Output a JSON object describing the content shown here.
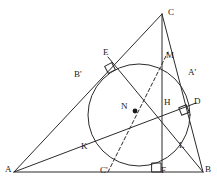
{
  "figure": {
    "type": "geometry-diagram",
    "width": 217,
    "height": 184,
    "stroke_color": "#2b2b2b",
    "background_color": "#ffffff",
    "labels": [
      {
        "key": "C",
        "text": "C",
        "x": 168,
        "y": 8
      },
      {
        "key": "E",
        "text": "E",
        "x": 103,
        "y": 48
      },
      {
        "key": "M",
        "text": "M",
        "x": 166,
        "y": 51
      },
      {
        "key": "Bp",
        "text": "B'",
        "x": 74,
        "y": 70
      },
      {
        "key": "Ap",
        "text": "A'",
        "x": 188,
        "y": 68
      },
      {
        "key": "N",
        "text": "N",
        "x": 121,
        "y": 102
      },
      {
        "key": "H",
        "text": "H",
        "x": 164,
        "y": 98
      },
      {
        "key": "D",
        "text": "D",
        "x": 194,
        "y": 97
      },
      {
        "key": "K",
        "text": "K",
        "x": 81,
        "y": 142
      },
      {
        "key": "L",
        "text": "L",
        "x": 179,
        "y": 141
      },
      {
        "key": "A",
        "text": "A",
        "x": 5,
        "y": 165
      },
      {
        "key": "Cp",
        "text": "C'",
        "x": 100,
        "y": 166
      },
      {
        "key": "F",
        "text": "F",
        "x": 161,
        "y": 166
      },
      {
        "key": "B",
        "text": "B",
        "x": 205,
        "y": 165
      }
    ],
    "points": {
      "A": [
        14,
        172
      ],
      "B": [
        203,
        172
      ],
      "C": [
        162,
        14
      ],
      "E": [
        113,
        61
      ],
      "M": [
        162,
        60
      ],
      "Bp": [
        88,
        84
      ],
      "Ap": [
        185,
        78
      ],
      "N": [
        135,
        111
      ],
      "H": [
        162,
        110
      ],
      "D": [
        190,
        105
      ],
      "K": [
        97,
        138
      ],
      "L": [
        175,
        152
      ],
      "Cp": [
        108,
        172
      ],
      "F": [
        162,
        172
      ]
    },
    "circle": {
      "cx": 139,
      "cy": 115,
      "r": 51,
      "name": "nine-point-circle"
    },
    "right_angle_marks": [
      {
        "name": "right-angle-at-E",
        "x": 110,
        "y": 68,
        "rot": -28
      },
      {
        "name": "right-angle-at-D",
        "x": 184,
        "y": 110,
        "rot": -22
      },
      {
        "name": "right-angle-at-F",
        "x": 152,
        "y": 163,
        "rot": 0
      }
    ],
    "dashed_segments": [
      {
        "name": "segment-C-prime-to-M",
        "from": "Cp",
        "to": "M"
      }
    ],
    "solid_segments": [
      {
        "name": "side-AB",
        "from": "A",
        "to": "B"
      },
      {
        "name": "side-AC",
        "from": "A",
        "to": "C"
      },
      {
        "name": "side-BC",
        "from": "C",
        "to": "B"
      },
      {
        "name": "altitude-C-to-F",
        "from": "C",
        "to": "F"
      },
      {
        "name": "cevian-A-to-D",
        "from": "A",
        "to": "D"
      },
      {
        "name": "cevian-B-to-E",
        "from": "B",
        "to": "E"
      }
    ]
  }
}
